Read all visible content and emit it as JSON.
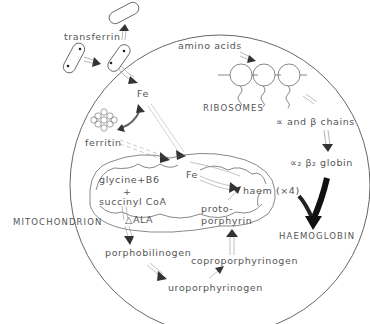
{
  "diagram": {
    "labels": {
      "transferrin": "transferrin",
      "amino_acids": "amino acids",
      "ribosomes": "RIBOSOMES",
      "fe_top": "Fe",
      "ferritin": "ferritin",
      "chains": "∝ and β chains",
      "globin": "∝₂ β₂ globin",
      "mitochondrion": "MITOCHONDRION",
      "glycine": "glycine+B6",
      "plus": "+",
      "succinyl": "succinyl CoA",
      "ala": "△ALA",
      "fe_mito": "Fe",
      "haem": "haem (×4)",
      "proto1": "proto-",
      "proto2": "porphyrin",
      "haemoglobin": "HAEMOGLOBIN",
      "porphobilinogen": "porphobilinogen",
      "coproporphyrinogen": "coproporphyrinogen",
      "uroporphyrinogen": "uroporphyrinogen"
    },
    "colors": {
      "line": "#555555",
      "arrow_head": "#333333",
      "haemoglobin_arrow": "#111111"
    }
  }
}
